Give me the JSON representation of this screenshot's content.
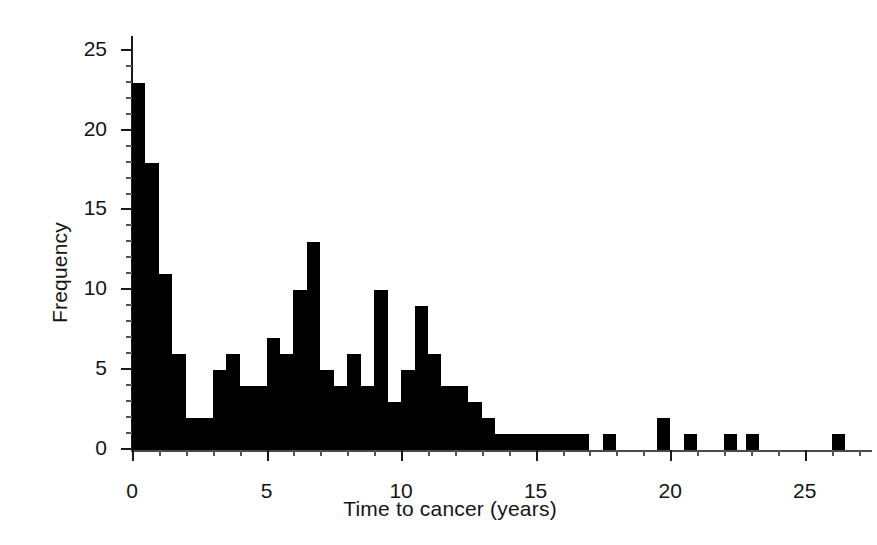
{
  "chart_data": {
    "type": "bar",
    "subtype": "histogram",
    "title": "",
    "xlabel": "Time to cancer (years)",
    "ylabel": "Frequency",
    "xlim": [
      0,
      27.5
    ],
    "ylim": [
      0,
      25.8
    ],
    "grid": false,
    "legend": null,
    "bin_width": 0.5,
    "bar_color": "#000000",
    "axis_color": "#1a1a1a",
    "background": "#ffffff",
    "xticks": [
      0,
      5,
      10,
      15,
      20,
      25
    ],
    "xtick_labels": [
      "0",
      "5",
      "10",
      "15",
      "20",
      "25"
    ],
    "xticks_minor": [
      1,
      2,
      3,
      4,
      6,
      7,
      8,
      9,
      11,
      12,
      13,
      14,
      16,
      17,
      18,
      19,
      21,
      22,
      23,
      24,
      26,
      27
    ],
    "yticks": [
      0,
      5,
      10,
      15,
      20,
      25
    ],
    "ytick_labels": [
      "0",
      "5",
      "10",
      "15",
      "20",
      "25"
    ],
    "yticks_minor": [
      1,
      2,
      3,
      4,
      6,
      7,
      8,
      9,
      11,
      12,
      13,
      14,
      16,
      17,
      18,
      19,
      21,
      22,
      23,
      24
    ],
    "bin_left_edges": [
      0.0,
      0.5,
      1.0,
      1.5,
      2.0,
      2.5,
      3.0,
      3.5,
      4.0,
      4.5,
      5.0,
      5.5,
      6.0,
      6.5,
      7.0,
      7.5,
      8.0,
      8.5,
      9.0,
      9.5,
      10.0,
      10.5,
      11.0,
      11.5,
      12.0,
      12.5,
      13.0,
      13.5,
      14.0,
      14.5,
      15.0,
      15.5,
      16.0,
      16.5,
      17.5,
      19.5,
      20.5,
      22.0,
      22.8,
      26.0
    ],
    "values": [
      23,
      18,
      11,
      6,
      2,
      2,
      5,
      6,
      4,
      4,
      7,
      6,
      10,
      13,
      5,
      4,
      6,
      4,
      10,
      3,
      5,
      9,
      6,
      4,
      4,
      3,
      2,
      1,
      1,
      1,
      1,
      1,
      1,
      1,
      1,
      2,
      1,
      1,
      1,
      1
    ]
  },
  "axes": {
    "xlabel": "Time to cancer (years)",
    "ylabel": "Frequency"
  }
}
